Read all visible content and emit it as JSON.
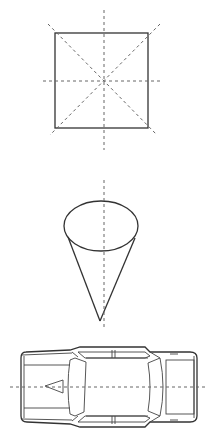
{
  "diagram": {
    "figures": [
      {
        "name": "square",
        "axes": [
          "vertical",
          "horizontal",
          "diagonal-1",
          "diagonal-2"
        ],
        "axis_count": 4
      },
      {
        "name": "cone",
        "axes": [
          "vertical"
        ],
        "axis_count": 1
      },
      {
        "name": "car-top-view",
        "axes": [
          "horizontal"
        ],
        "axis_count": 1
      }
    ],
    "colors": {
      "line": "#333333",
      "axis": "#666666",
      "background": "#ffffff"
    }
  }
}
